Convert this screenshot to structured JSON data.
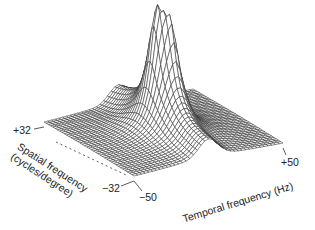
{
  "chart_data": {
    "type": "surface",
    "title": "",
    "x_axis": {
      "label": "Temporal frequency (Hz)",
      "range": [
        -50,
        50
      ],
      "tick_labels": [
        "-50",
        "+50"
      ]
    },
    "y_axis": {
      "label_line1": "Spatial frequency",
      "label_line2": "(cycles/degree)",
      "range": [
        -32,
        32
      ],
      "tick_labels": [
        "-32",
        "+32"
      ]
    },
    "z_axis": {
      "label": "",
      "range": [
        0,
        1
      ]
    },
    "grid": {
      "nx": 40,
      "ny": 40
    },
    "surface": {
      "description": "Spatiotemporal power spectrum: sharp twin peak near origin, ridges along zero temporal frequency, flat floor elsewhere",
      "peaks": [
        {
          "tf": -3,
          "sf": 2,
          "height": 1.0
        },
        {
          "tf": 3,
          "sf": -2,
          "height": 0.85
        }
      ],
      "floor": 0.02
    },
    "projection": {
      "front_corner": [
        134,
        181
      ],
      "left_corner": [
        44,
        127
      ],
      "right_corner": [
        283,
        148
      ],
      "z_scale": 175
    },
    "labels": {
      "plus32": "+32",
      "minus32": "−32",
      "minus50": "−50",
      "plus50": "+50"
    },
    "mesh_color": "#333333",
    "fill_color": "#ffffff"
  }
}
